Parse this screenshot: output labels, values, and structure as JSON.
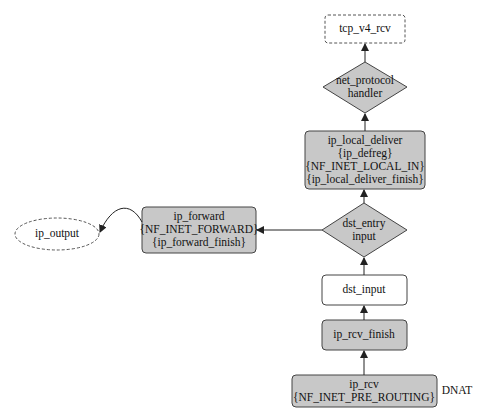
{
  "colors": {
    "node_fill": "#c8c8c8",
    "node_stroke": "#444444",
    "plain_fill": "#ffffff",
    "edge": "#222222"
  },
  "nodes": {
    "tcp_v4_rcv": {
      "label": "tcp_v4_rcv"
    },
    "net_protocol": {
      "line1": "net_protocol",
      "line2": "handler"
    },
    "ip_local_deliver": {
      "line1": "ip_local_deliver",
      "line2": "{ip_defreg}",
      "line3": "{NF_INET_LOCAL_IN}",
      "line4": "{ip_local_deliver_finish}"
    },
    "dst_entry": {
      "line1": "dst_entry",
      "line2": "input"
    },
    "ip_forward": {
      "line1": "ip_forward",
      "line2": "{NF_INET_FORWARD}",
      "line3": "{ip_forward_finish}"
    },
    "ip_output": {
      "label": "ip_output"
    },
    "dst_input": {
      "label": "dst_input"
    },
    "ip_rcv_finish": {
      "label": "ip_rcv_finish"
    },
    "ip_rcv": {
      "line1": "ip_rcv",
      "line2": "{NF_INET_PRE_ROUTING}"
    }
  },
  "annotations": {
    "dnat": "DNAT"
  }
}
